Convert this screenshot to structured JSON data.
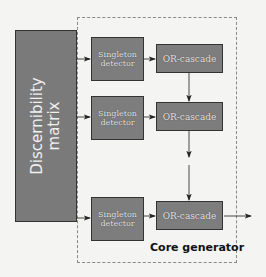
{
  "diagram": {
    "matrix": {
      "label_line1": "Discernibility",
      "label_line2": "matrix"
    },
    "container": {
      "label": "Core generator"
    },
    "rows": [
      {
        "detector_line1": "Singleton",
        "detector_line2": "detector",
        "cascade": "OR-cascade"
      },
      {
        "detector_line1": "Singleton",
        "detector_line2": "detector",
        "cascade": "OR-cascade"
      },
      {
        "detector_line1": "Singleton",
        "detector_line2": "detector",
        "cascade": "OR-cascade"
      }
    ],
    "colors": {
      "box_fill": "#7d7d7d",
      "box_border": "#333333",
      "background": "#f4f4f2",
      "text_light": "#e8e8e8"
    }
  }
}
